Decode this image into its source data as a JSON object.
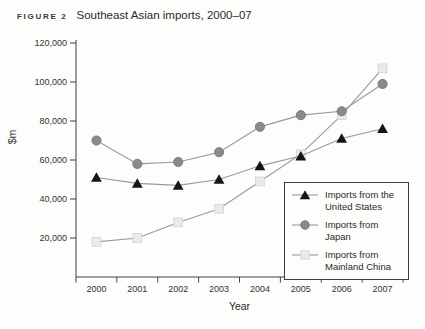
{
  "figure": {
    "label": "FIGURE 2",
    "title": "Southeast Asian imports, 2000–07"
  },
  "chart_data": {
    "type": "line",
    "title": "Southeast Asian imports, 2000–07",
    "categories": [
      "2000",
      "2001",
      "2002",
      "2003",
      "2004",
      "2005",
      "2006",
      "2007"
    ],
    "series": [
      {
        "key": "us",
        "name": "Imports from the United States",
        "marker": "triangle",
        "values": [
          51000,
          48000,
          47000,
          50000,
          57000,
          62000,
          71000,
          76000
        ]
      },
      {
        "key": "japan",
        "name": "Imports from Japan",
        "marker": "circle",
        "values": [
          70000,
          58000,
          59000,
          64000,
          77000,
          83000,
          85000,
          99000
        ]
      },
      {
        "key": "china",
        "name": "Imports from Mainland China",
        "marker": "square",
        "values": [
          18000,
          20000,
          28000,
          35000,
          49000,
          63000,
          83000,
          107000
        ]
      }
    ],
    "xlabel": "Year",
    "ylabel": "$m",
    "ylim": [
      0,
      120000
    ],
    "ytick_values": [
      20000,
      40000,
      60000,
      80000,
      100000,
      120000
    ],
    "ytick_labels": [
      "20,000",
      "40,000",
      "60,000",
      "80,000",
      "100,000",
      "120,000"
    ],
    "grid": false,
    "legend_position": "inside-bottom-right"
  },
  "legend": {
    "items": [
      {
        "marker": "triangle",
        "line1": "Imports from the",
        "line2": "United States"
      },
      {
        "marker": "circle",
        "line1": "Imports from Japan",
        "line2": ""
      },
      {
        "marker": "square",
        "line1": "Imports from",
        "line2": "Mainland China"
      }
    ]
  },
  "colors": {
    "us_marker": "#151515",
    "japan_marker_fill": "#8a8a8a",
    "japan_marker_stroke": "#707070",
    "china_marker_fill": "#eaeaea",
    "china_marker_stroke": "#d2d2d2",
    "series_line": "#999999",
    "axis": "#3f3f3f",
    "text": "#333333"
  }
}
